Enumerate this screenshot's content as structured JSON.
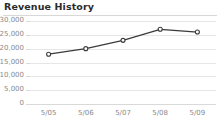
{
  "widget": {
    "title": "Revenue History",
    "background_color": "#ffffff",
    "title_color": "#2b2b2b",
    "rule_color": "#d8d8d8"
  },
  "chart_data": {
    "type": "line",
    "title": "Revenue History",
    "xlabel": "",
    "ylabel": "",
    "categories": [
      "5/05",
      "5/06",
      "5/07",
      "5/08",
      "5/09"
    ],
    "values": [
      18000,
      20000,
      23000,
      27000,
      26000
    ],
    "series": [
      {
        "name": "Revenue",
        "values": [
          18000,
          20000,
          23000,
          27000,
          26000
        ]
      }
    ],
    "ylim": [
      0,
      30000
    ],
    "yticks": [
      0,
      5000,
      10000,
      15000,
      20000,
      25000,
      30000
    ],
    "ytick_labels": [
      "0",
      "5,000",
      "10,000",
      "15,000",
      "20,000",
      "25,000",
      "30,000"
    ],
    "xtick_labels": [
      "5/05",
      "5/06",
      "5/07",
      "5/08",
      "5/09"
    ],
    "grid": true,
    "grid_axis": "y",
    "legend": false,
    "legend_position": "none",
    "line_color": "#3b3b3b",
    "line_width": 1.3,
    "marker": "circle",
    "marker_face_color": "#ffffff",
    "marker_edge_color": "#3b3b3b",
    "marker_size": 4,
    "tick_label_color": "#8a8a8a",
    "gridline_color": "#e6e6e6"
  }
}
